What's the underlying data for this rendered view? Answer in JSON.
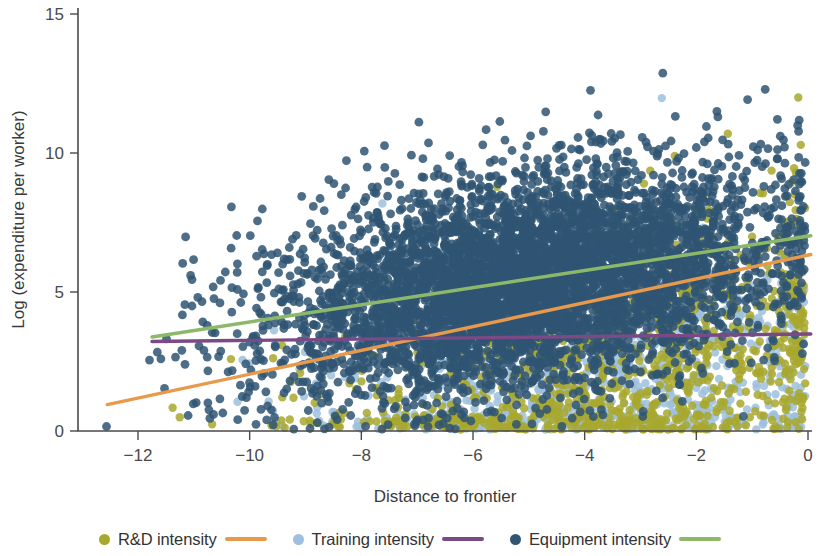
{
  "chart_data": {
    "type": "scatter",
    "title": "",
    "xlabel": "Distance to frontier",
    "ylabel": "Log (expenditure per worker)",
    "xlim": [
      -12.9,
      0.3
    ],
    "ylim": [
      -0.45,
      15.4
    ],
    "xticks": [
      -12,
      -10,
      -8,
      -6,
      -4,
      -2,
      0
    ],
    "xtick_labels": [
      "−12",
      "−10",
      "−8",
      "−6",
      "−4",
      "−2",
      "0"
    ],
    "yticks": [
      0,
      5,
      10,
      15
    ],
    "ytick_labels": [
      "0",
      "5",
      "10",
      "15"
    ],
    "grid": false,
    "legend_position": "bottom",
    "marker_size": 8,
    "marker_opacity": 0.85,
    "series": [
      {
        "name": "R&D intensity",
        "point_color": "#a8a82e",
        "line_color": "#e8994a",
        "n_points": 1100,
        "cluster": {
          "x_mean": -3.3,
          "x_sd": 2.5,
          "y_mean": 2.4,
          "y_sd": 2.6,
          "slope": 0.42,
          "y_min": 0.05,
          "y_max": 14.0
        },
        "fit_line": {
          "x_start": -12.55,
          "y_start": 0.95,
          "x_end": 0.05,
          "y_end": 6.35
        }
      },
      {
        "name": "Training intensity",
        "point_color": "#9ebfdd",
        "line_color": "#7a4a86",
        "n_points": 950,
        "cluster": {
          "x_mean": -3.8,
          "x_sd": 2.3,
          "y_mean": 2.0,
          "y_sd": 2.2,
          "slope": 0.05,
          "y_min": 0.05,
          "y_max": 12.0
        },
        "fit_line": {
          "x_start": -11.75,
          "y_start": 3.22,
          "x_end": 0.05,
          "y_end": 3.49
        }
      },
      {
        "name": "Equipment intensity",
        "point_color": "#2f5573",
        "line_color": "#8cb86a",
        "n_points": 5200,
        "cluster": {
          "x_mean": -5.0,
          "x_sd": 2.2,
          "y_mean": 5.4,
          "y_sd": 1.9,
          "slope": 0.3,
          "y_min": 0.05,
          "y_max": 14.0
        },
        "fit_line": {
          "x_start": -11.75,
          "y_start": 3.38,
          "x_end": 0.05,
          "y_end": 7.02
        }
      }
    ]
  },
  "axes": {
    "x_title": "Distance to frontier",
    "y_title": "Log (expenditure per worker)",
    "x_tick_labels": [
      "−12",
      "−10",
      "−8",
      "−6",
      "−4",
      "−2",
      "0"
    ],
    "y_tick_labels": [
      "0",
      "5",
      "10",
      "15"
    ]
  },
  "legend": {
    "items": [
      {
        "label": "R&D intensity",
        "dot_color": "#a8a82e",
        "line_color": "#e8994a"
      },
      {
        "label": "Training intensity",
        "dot_color": "#9ebfdd",
        "line_color": "#7a4a86"
      },
      {
        "label": "Equipment intensity",
        "dot_color": "#2f5573",
        "line_color": "#8cb86a"
      }
    ]
  }
}
